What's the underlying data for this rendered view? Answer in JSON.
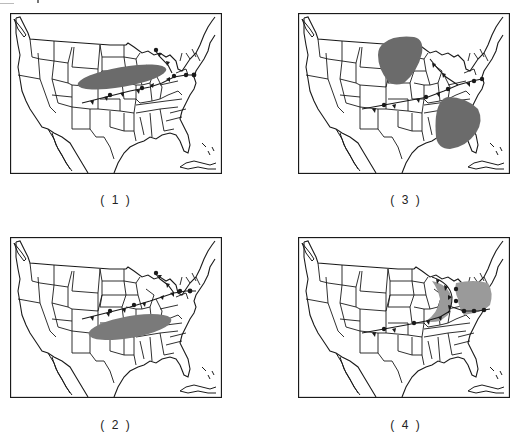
{
  "figure": {
    "panels": [
      {
        "id": 1,
        "caption": "( 1 )",
        "precip_regions": [
          "central-plains-to-great-lakes"
        ]
      },
      {
        "id": 2,
        "caption": "( 2 )",
        "precip_regions": [
          "southern-plains-to-southeast"
        ]
      },
      {
        "id": 3,
        "caption": "( 3 )",
        "precip_regions": [
          "upper-midwest",
          "southeast"
        ]
      },
      {
        "id": 4,
        "caption": "( 4 )",
        "precip_regions": [
          "ohio-valley-to-mid-atlantic"
        ]
      }
    ],
    "legend": {
      "front_symbols": [
        "cold-front-triangles",
        "warm-front-semicircles"
      ],
      "shading": "precipitation-area"
    },
    "colors": {
      "map_line": "#1a1a1a",
      "shading_dark": "#6b6b6b",
      "shading_light": "#9a9a9a"
    }
  }
}
